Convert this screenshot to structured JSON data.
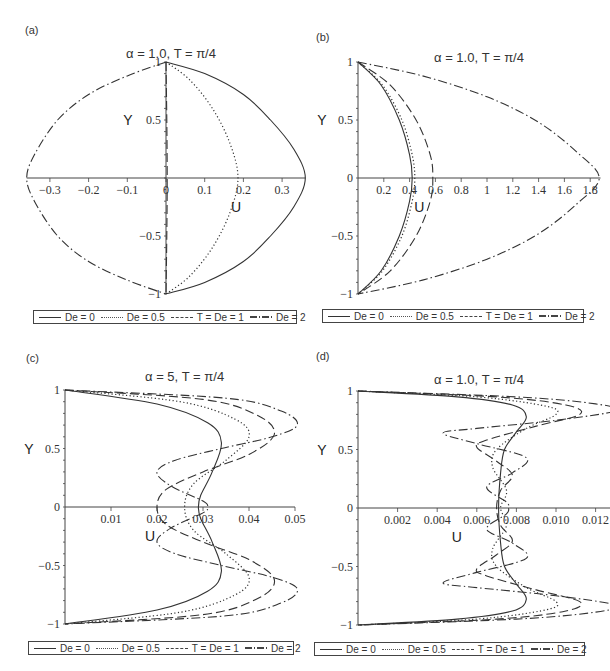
{
  "chart_data": [
    {
      "panel": "(a)",
      "type": "line",
      "title": "α = 1.0, T = π/4",
      "xlabel": "U",
      "ylabel": "Y",
      "xlim": [
        -0.36,
        0.36
      ],
      "ylim": [
        -1,
        1
      ],
      "xticks": [
        "−0.3",
        "−0.2",
        "−0.1",
        "0",
        "0.1",
        "0.2",
        "0.3"
      ],
      "yticks": [
        "1",
        "0.5",
        "−0.5",
        "−1"
      ],
      "grid": false,
      "legend_position": "bottom",
      "series": [
        {
          "name": "De = 0",
          "style": "solid",
          "points": [
            [
              0,
              1
            ],
            [
              0.1,
              0.9
            ],
            [
              0.2,
              0.72
            ],
            [
              0.27,
              0.5
            ],
            [
              0.33,
              0.25
            ],
            [
              0.36,
              0
            ],
            [
              0.33,
              -0.25
            ],
            [
              0.27,
              -0.5
            ],
            [
              0.2,
              -0.72
            ],
            [
              0.1,
              -0.9
            ],
            [
              0,
              -1
            ]
          ]
        },
        {
          "name": "De = 0.5",
          "style": "dotted",
          "points": [
            [
              0,
              1
            ],
            [
              0.06,
              0.85
            ],
            [
              0.12,
              0.6
            ],
            [
              0.165,
              0.3
            ],
            [
              0.186,
              0
            ],
            [
              0.165,
              -0.3
            ],
            [
              0.12,
              -0.6
            ],
            [
              0.06,
              -0.85
            ],
            [
              0,
              -1
            ]
          ]
        },
        {
          "name": "T = De = 1",
          "style": "dashed",
          "points": [
            [
              0,
              1
            ],
            [
              0.002,
              0.5
            ],
            [
              0.003,
              0
            ],
            [
              0.002,
              -0.5
            ],
            [
              0,
              -1
            ]
          ]
        },
        {
          "name": "De = 2",
          "style": "dashdot",
          "points": [
            [
              0,
              1
            ],
            [
              -0.1,
              0.88
            ],
            [
              -0.2,
              0.72
            ],
            [
              -0.28,
              0.5
            ],
            [
              -0.34,
              0.2
            ],
            [
              -0.36,
              0
            ],
            [
              -0.34,
              -0.2
            ],
            [
              -0.28,
              -0.5
            ],
            [
              -0.2,
              -0.72
            ],
            [
              -0.1,
              -0.88
            ],
            [
              0,
              -1
            ]
          ]
        }
      ]
    },
    {
      "panel": "(b)",
      "type": "line",
      "title": "α = 1.0, T = π/4",
      "xlabel": "U",
      "ylabel": "Y",
      "xlim": [
        0,
        1.88
      ],
      "ylim": [
        -1,
        1
      ],
      "xticks": [
        "0.2",
        "0.4",
        "0.6",
        "0.8",
        "1",
        "1.2",
        "1.4",
        "1.6",
        "1.8"
      ],
      "yticks": [
        "1",
        "0.5",
        "0",
        "−0.5",
        "−1"
      ],
      "grid": false,
      "legend_position": "bottom",
      "series": [
        {
          "name": "De = 0",
          "style": "solid",
          "points": [
            [
              0,
              1
            ],
            [
              0.18,
              0.8
            ],
            [
              0.32,
              0.5
            ],
            [
              0.4,
              0.2
            ],
            [
              0.42,
              0
            ],
            [
              0.4,
              -0.2
            ],
            [
              0.32,
              -0.5
            ],
            [
              0.18,
              -0.8
            ],
            [
              0,
              -1
            ]
          ]
        },
        {
          "name": "De = 0.5",
          "style": "dotted",
          "points": [
            [
              0,
              1
            ],
            [
              0.19,
              0.8
            ],
            [
              0.34,
              0.5
            ],
            [
              0.42,
              0.2
            ],
            [
              0.44,
              0
            ],
            [
              0.42,
              -0.2
            ],
            [
              0.34,
              -0.5
            ],
            [
              0.19,
              -0.8
            ],
            [
              0,
              -1
            ]
          ]
        },
        {
          "name": "T = De = 1",
          "style": "dashed",
          "points": [
            [
              0,
              1
            ],
            [
              0.25,
              0.8
            ],
            [
              0.45,
              0.5
            ],
            [
              0.56,
              0.2
            ],
            [
              0.58,
              0
            ],
            [
              0.56,
              -0.2
            ],
            [
              0.45,
              -0.5
            ],
            [
              0.25,
              -0.8
            ],
            [
              0,
              -1
            ]
          ]
        },
        {
          "name": "De = 2",
          "style": "dashdot",
          "points": [
            [
              0,
              1
            ],
            [
              0.5,
              0.88
            ],
            [
              1.0,
              0.7
            ],
            [
              1.4,
              0.48
            ],
            [
              1.7,
              0.22
            ],
            [
              1.87,
              0
            ],
            [
              1.7,
              -0.22
            ],
            [
              1.4,
              -0.48
            ],
            [
              1.0,
              -0.7
            ],
            [
              0.5,
              -0.88
            ],
            [
              0,
              -1
            ]
          ]
        }
      ]
    },
    {
      "panel": "(c)",
      "type": "line",
      "title": "α = 5, T = π/4",
      "xlabel": "U",
      "ylabel": "Y",
      "xlim": [
        0,
        0.05
      ],
      "ylim": [
        -1,
        1
      ],
      "xticks": [
        "0.01",
        "0.02",
        "0.03",
        "0.04",
        "0.05"
      ],
      "yticks": [
        "1",
        "0.5",
        "0",
        "−0.5",
        "−1"
      ],
      "grid": false,
      "legend_position": "bottom",
      "series": [
        {
          "name": "De = 0",
          "style": "solid",
          "points": [
            [
              0,
              1
            ],
            [
              0.02,
              0.88
            ],
            [
              0.031,
              0.72
            ],
            [
              0.034,
              0.55
            ],
            [
              0.032,
              0.3
            ],
            [
              0.0295,
              0.1
            ],
            [
              0.029,
              0
            ],
            [
              0.0295,
              -0.1
            ],
            [
              0.032,
              -0.3
            ],
            [
              0.034,
              -0.55
            ],
            [
              0.031,
              -0.72
            ],
            [
              0.02,
              -0.88
            ],
            [
              0,
              -1
            ]
          ]
        },
        {
          "name": "De = 0.5",
          "style": "dotted",
          "points": [
            [
              0,
              1
            ],
            [
              0.025,
              0.9
            ],
            [
              0.037,
              0.75
            ],
            [
              0.04,
              0.6
            ],
            [
              0.035,
              0.4
            ],
            [
              0.028,
              0.2
            ],
            [
              0.026,
              0
            ],
            [
              0.028,
              -0.2
            ],
            [
              0.035,
              -0.4
            ],
            [
              0.04,
              -0.6
            ],
            [
              0.037,
              -0.75
            ],
            [
              0.025,
              -0.9
            ],
            [
              0,
              -1
            ]
          ]
        },
        {
          "name": "T = De = 1",
          "style": "dashed",
          "points": [
            [
              0,
              1
            ],
            [
              0.03,
              0.92
            ],
            [
              0.042,
              0.78
            ],
            [
              0.0455,
              0.62
            ],
            [
              0.04,
              0.45
            ],
            [
              0.03,
              0.3
            ],
            [
              0.022,
              0.15
            ],
            [
              0.02,
              0
            ],
            [
              0.022,
              -0.15
            ],
            [
              0.03,
              -0.3
            ],
            [
              0.04,
              -0.45
            ],
            [
              0.0455,
              -0.62
            ],
            [
              0.042,
              -0.78
            ],
            [
              0.03,
              -0.92
            ],
            [
              0,
              -1
            ]
          ]
        },
        {
          "name": "De = 2",
          "style": "dashdot",
          "points": [
            [
              0,
              1
            ],
            [
              0.035,
              0.93
            ],
            [
              0.047,
              0.82
            ],
            [
              0.0505,
              0.7
            ],
            [
              0.045,
              0.6
            ],
            [
              0.034,
              0.5
            ],
            [
              0.024,
              0.4
            ],
            [
              0.02,
              0.3
            ],
            [
              0.023,
              0.18
            ],
            [
              0.03,
              0.05
            ],
            [
              0.031,
              0
            ],
            [
              0.03,
              -0.05
            ],
            [
              0.023,
              -0.18
            ],
            [
              0.02,
              -0.3
            ],
            [
              0.024,
              -0.4
            ],
            [
              0.034,
              -0.5
            ],
            [
              0.045,
              -0.6
            ],
            [
              0.0505,
              -0.7
            ],
            [
              0.047,
              -0.82
            ],
            [
              0.035,
              -0.93
            ],
            [
              0,
              -1
            ]
          ]
        }
      ]
    },
    {
      "panel": "(d)",
      "type": "line",
      "title": "α = 1.0, T = π/4",
      "xlabel": "U",
      "ylabel": "Y",
      "xlim": [
        0,
        0.013
      ],
      "ylim": [
        -1,
        1
      ],
      "xticks": [
        "0.002",
        "0.004",
        "0.006",
        "0.008",
        "0.010",
        "0.012"
      ],
      "yticks": [
        "1",
        "0.5",
        "0",
        "−0.5",
        "−1"
      ],
      "grid": false,
      "legend_position": "bottom",
      "series": [
        {
          "name": "De = 0",
          "style": "solid",
          "points": [
            [
              0,
              1
            ],
            [
              0.005,
              0.95
            ],
            [
              0.0078,
              0.88
            ],
            [
              0.0085,
              0.78
            ],
            [
              0.008,
              0.65
            ],
            [
              0.0074,
              0.5
            ],
            [
              0.0072,
              0.3
            ],
            [
              0.0071,
              0
            ],
            [
              0.0072,
              -0.3
            ],
            [
              0.0074,
              -0.5
            ],
            [
              0.008,
              -0.65
            ],
            [
              0.0085,
              -0.78
            ],
            [
              0.0078,
              -0.88
            ],
            [
              0.005,
              -0.95
            ],
            [
              0,
              -1
            ]
          ]
        },
        {
          "name": "De = 0.5",
          "style": "dotted",
          "points": [
            [
              0,
              1
            ],
            [
              0.006,
              0.95
            ],
            [
              0.0095,
              0.87
            ],
            [
              0.01,
              0.8
            ],
            [
              0.0085,
              0.68
            ],
            [
              0.007,
              0.5
            ],
            [
              0.0068,
              0.35
            ],
            [
              0.0075,
              0.15
            ],
            [
              0.0072,
              0
            ],
            [
              0.0075,
              -0.15
            ],
            [
              0.0068,
              -0.35
            ],
            [
              0.007,
              -0.5
            ],
            [
              0.0085,
              -0.68
            ],
            [
              0.01,
              -0.8
            ],
            [
              0.0095,
              -0.87
            ],
            [
              0.006,
              -0.95
            ],
            [
              0,
              -1
            ]
          ]
        },
        {
          "name": "T = De = 1",
          "style": "dashed",
          "points": [
            [
              0,
              1
            ],
            [
              0.007,
              0.95
            ],
            [
              0.0105,
              0.88
            ],
            [
              0.0112,
              0.8
            ],
            [
              0.009,
              0.7
            ],
            [
              0.0065,
              0.58
            ],
            [
              0.006,
              0.52
            ],
            [
              0.007,
              0.4
            ],
            [
              0.0078,
              0.28
            ],
            [
              0.0072,
              0.15
            ],
            [
              0.007,
              0
            ],
            [
              0.0072,
              -0.15
            ],
            [
              0.0078,
              -0.28
            ],
            [
              0.007,
              -0.4
            ],
            [
              0.006,
              -0.52
            ],
            [
              0.0065,
              -0.58
            ],
            [
              0.009,
              -0.7
            ],
            [
              0.0112,
              -0.8
            ],
            [
              0.0105,
              -0.88
            ],
            [
              0.007,
              -0.95
            ],
            [
              0,
              -1
            ]
          ]
        },
        {
          "name": "De = 2",
          "style": "dashdot",
          "points": [
            [
              0,
              1
            ],
            [
              0.008,
              0.95
            ],
            [
              0.012,
              0.89
            ],
            [
              0.013,
              0.83
            ],
            [
              0.01,
              0.75
            ],
            [
              0.006,
              0.68
            ],
            [
              0.0043,
              0.64
            ],
            [
              0.006,
              0.55
            ],
            [
              0.0085,
              0.43
            ],
            [
              0.0078,
              0.3
            ],
            [
              0.0065,
              0.18
            ],
            [
              0.0075,
              0.05
            ],
            [
              0.0076,
              0
            ],
            [
              0.0075,
              -0.05
            ],
            [
              0.0065,
              -0.18
            ],
            [
              0.0078,
              -0.3
            ],
            [
              0.0085,
              -0.43
            ],
            [
              0.006,
              -0.55
            ],
            [
              0.0043,
              -0.64
            ],
            [
              0.006,
              -0.68
            ],
            [
              0.01,
              -0.75
            ],
            [
              0.013,
              -0.83
            ],
            [
              0.012,
              -0.89
            ],
            [
              0.008,
              -0.95
            ],
            [
              0,
              -1
            ]
          ]
        }
      ]
    }
  ],
  "panels": [
    {
      "label": "(a)",
      "title": "α = 1.0, T = π/4",
      "xlabel": "U",
      "ylabel": "Y"
    },
    {
      "label": "(b)",
      "title": "α = 1.0, T = π/4",
      "xlabel": "U",
      "ylabel": "Y"
    },
    {
      "label": "(c)",
      "title": "α = 5, T = π/4",
      "xlabel": "U",
      "ylabel": "Y"
    },
    {
      "label": "(d)",
      "title": "α = 1.0, T = π/4",
      "xlabel": "U",
      "ylabel": "Y"
    }
  ],
  "legend": {
    "items": [
      {
        "label": "De = 0",
        "style": "solid"
      },
      {
        "label": "De = 0.5",
        "style": "dotted"
      },
      {
        "label": "T = De = 1",
        "style": "dashed"
      },
      {
        "label": "De = 2",
        "style": "dashdot"
      }
    ]
  },
  "colors": {
    "line": "#333333",
    "axis": "#444444",
    "text": "#333333",
    "background": "#ffffff"
  }
}
